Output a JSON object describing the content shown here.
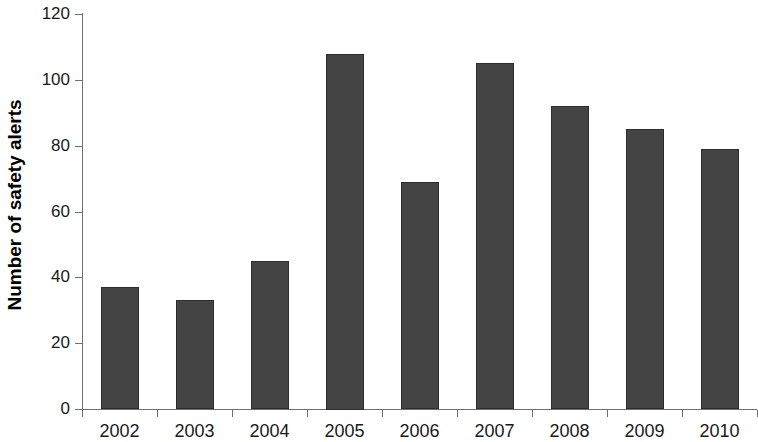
{
  "chart_data": {
    "type": "bar",
    "title": "",
    "subtitle": "",
    "xlabel": "",
    "ylabel": "Number of safety alerts",
    "categories": [
      "2002",
      "2003",
      "2004",
      "2005",
      "2006",
      "2007",
      "2008",
      "2009",
      "2010"
    ],
    "values": [
      37,
      33,
      45,
      108,
      69,
      105,
      92,
      85,
      79
    ],
    "series": [
      {
        "name": "Number of safety alerts",
        "values": [
          37,
          33,
          45,
          108,
          69,
          105,
          92,
          85,
          79
        ]
      }
    ],
    "ylim": [
      0,
      120
    ],
    "ytick_values": [
      0,
      20,
      40,
      60,
      80,
      100,
      120
    ],
    "ytick_labels": [
      "0",
      "20",
      "40",
      "60",
      "80",
      "100",
      "120"
    ],
    "grid": false,
    "legend": false,
    "legend_position": "none",
    "bar_color": "#444444",
    "bar_edge_color": "#2d2d2d",
    "axis_color": "#6f6f6f",
    "background_color": "#ffffff"
  }
}
